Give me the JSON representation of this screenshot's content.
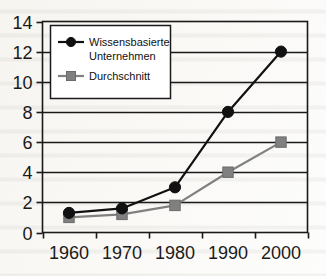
{
  "chart_data": {
    "type": "line",
    "title": "",
    "xlabel": "",
    "ylabel": "",
    "categories": [
      "1960",
      "1970",
      "1980",
      "1990",
      "2000"
    ],
    "ylim": [
      0,
      14
    ],
    "ytick_step": 2,
    "yticks": [
      "0",
      "2",
      "4",
      "6",
      "8",
      "10",
      "12",
      "14"
    ],
    "grid": "horizontal",
    "legend_position": "top-left-inside",
    "series": [
      {
        "name": "Wissensbasierte Unternehmen",
        "color": "#111111",
        "marker": "circle",
        "values": [
          1.3,
          1.6,
          3.0,
          8.0,
          12.0
        ]
      },
      {
        "name": "Durchschnitt",
        "color": "#808080",
        "marker": "square",
        "values": [
          1.0,
          1.2,
          1.8,
          4.0,
          6.0
        ]
      }
    ]
  },
  "legend": {
    "entries": [
      {
        "label_line1": "Wissensbasierte",
        "label_line2": "Unternehmen"
      },
      {
        "label_line1": "Durchschnitt",
        "label_line2": ""
      }
    ]
  },
  "colors": {
    "series_primary": "#111111",
    "series_secondary": "#808080",
    "axis": "#1a1a1a",
    "grid": "#1a1a1a",
    "background": "#fdfdfc"
  }
}
